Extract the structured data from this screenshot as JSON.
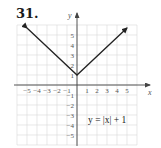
{
  "problem_number": "31.",
  "chart_data": {
    "type": "line",
    "title": "",
    "equation_label": "y = |x| + 1",
    "xlabel": "x",
    "ylabel": "y",
    "xlim": [
      -6,
      6
    ],
    "ylim": [
      -6,
      6
    ],
    "grid": true,
    "x_tick_labels": [
      "−5",
      "−4",
      "−3",
      "−2",
      "−1",
      "1",
      "2",
      "3",
      "4",
      "5"
    ],
    "y_tick_labels": [
      "5",
      "4",
      "3",
      "2",
      "1",
      "−1",
      "−2",
      "−3",
      "−4",
      "−5"
    ],
    "x_ticks": [
      -5,
      -4,
      -3,
      -2,
      -1,
      1,
      2,
      3,
      4,
      5
    ],
    "y_ticks": [
      5,
      4,
      3,
      2,
      1,
      -1,
      -2,
      -3,
      -4,
      -5
    ],
    "series": [
      {
        "name": "y = |x| + 1",
        "x": [
          -5,
          0,
          5
        ],
        "y": [
          6,
          1,
          6
        ],
        "arrows": "both-ends",
        "color": "#222222"
      }
    ],
    "vertex": [
      0,
      1
    ]
  },
  "colors": {
    "grid": "#d9d9d9",
    "axis": "#444444",
    "curve": "#222222",
    "text": "#555555"
  }
}
